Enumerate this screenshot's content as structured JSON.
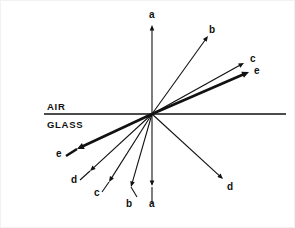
{
  "figure": {
    "width": 295,
    "height": 228,
    "background_color": "#ffffff",
    "stroke_color": "#111111"
  },
  "interface": {
    "name": "air-glass-boundary",
    "x_start": 43,
    "x_end": 285,
    "y": 113,
    "thickness": 1.6,
    "upper_medium_label": "AIR",
    "lower_medium_label": "GLASS",
    "upper_label_x": 46,
    "upper_label_y": 101,
    "lower_label_x": 46,
    "lower_label_y": 119
  },
  "origin": {
    "name": "incidence-point",
    "x": 151,
    "y": 113
  },
  "chart_data": {
    "type": "diagram",
    "media": [
      "AIR",
      "GLASS"
    ],
    "ray_labels": [
      "a",
      "b",
      "c",
      "d",
      "e"
    ]
  },
  "rays": [
    {
      "id": "ray-a-upper",
      "label": "a",
      "region": "air",
      "x1": 151,
      "y1": 113,
      "x2": 151,
      "y2": 24,
      "width": 1.1,
      "head": 5.5,
      "label_x": 148,
      "label_y": 9
    },
    {
      "id": "ray-b-upper",
      "label": "b",
      "region": "air",
      "x1": 151,
      "y1": 113,
      "x2": 207,
      "y2": 35,
      "width": 1.1,
      "head": 5.5,
      "label_x": 208,
      "label_y": 24
    },
    {
      "id": "ray-c-upper",
      "label": "c",
      "region": "air",
      "x1": 151,
      "y1": 113,
      "x2": 243,
      "y2": 62,
      "width": 1.2,
      "head": 5.5,
      "label_x": 249,
      "label_y": 53
    },
    {
      "id": "ray-e-upper",
      "label": "e",
      "region": "air",
      "x1": 151,
      "y1": 113,
      "x2": 248,
      "y2": 71,
      "width": 2.6,
      "head": 7,
      "label_x": 253,
      "label_y": 65
    },
    {
      "id": "ray-d-lower-right",
      "label": "d",
      "region": "glass",
      "x1": 151,
      "y1": 113,
      "x2": 222,
      "y2": 178,
      "width": 1.1,
      "head": 5.5,
      "label_x": 226,
      "label_y": 181
    },
    {
      "id": "ray-e-lower-left",
      "label": "e",
      "region": "glass",
      "x1": 151,
      "y1": 113,
      "x2": 76,
      "y2": 148,
      "width": 2.6,
      "head": 7,
      "label_x": 55,
      "label_y": 148
    },
    {
      "id": "ray-d-lower-left",
      "label": "d",
      "region": "glass",
      "x1": 151,
      "y1": 113,
      "x2": 89,
      "y2": 170,
      "width": 1.1,
      "head": 5.5,
      "label_x": 70,
      "label_y": 174
    },
    {
      "id": "ray-c-lower-left",
      "label": "c",
      "region": "glass",
      "x1": 151,
      "y1": 113,
      "x2": 108,
      "y2": 181,
      "width": 1.1,
      "head": 5.5,
      "label_x": 93,
      "label_y": 187
    },
    {
      "id": "ray-b-lower-left",
      "label": "b",
      "region": "glass",
      "x1": 151,
      "y1": 113,
      "x2": 130,
      "y2": 186,
      "width": 1.1,
      "head": 5.5,
      "label_x": 125,
      "label_y": 198
    },
    {
      "id": "ray-a-lower",
      "label": "a",
      "region": "glass",
      "x1": 151,
      "y1": 113,
      "x2": 151,
      "y2": 185,
      "width": 1.1,
      "head": 5.5,
      "label_x": 148,
      "label_y": 198
    }
  ],
  "tails": [
    {
      "id": "tail-a-lower",
      "x1": 151,
      "y1": 203,
      "x2": 151,
      "y2": 186,
      "width": 1.1
    },
    {
      "id": "tail-b-lower",
      "x1": 136,
      "y1": 196,
      "x2": 130,
      "y2": 186,
      "width": 1.1
    },
    {
      "id": "tail-c-lower",
      "x1": 101,
      "y1": 191,
      "x2": 108,
      "y2": 181,
      "width": 1.1
    },
    {
      "id": "tail-d-lower",
      "x1": 79,
      "y1": 179,
      "x2": 89,
      "y2": 170,
      "width": 1.1
    },
    {
      "id": "tail-e-lower",
      "x1": 65,
      "y1": 155,
      "x2": 76,
      "y2": 148,
      "width": 2.6
    }
  ]
}
